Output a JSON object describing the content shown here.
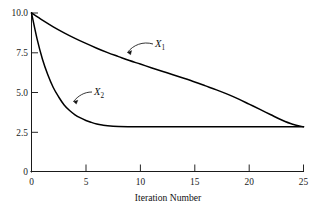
{
  "chart_data": {
    "type": "line",
    "title": "",
    "subtitle": "",
    "xlabel": "Iteration Number",
    "ylabel": "",
    "xlim": [
      0,
      25
    ],
    "ylim": [
      0,
      10.0
    ],
    "grid": false,
    "legend_position": "inline-annotations",
    "xticks": [
      0,
      5,
      10,
      15,
      20,
      25
    ],
    "xticklabels": [
      "0",
      "5",
      "10",
      "15",
      "20",
      "25"
    ],
    "yticks": [
      0,
      2.5,
      5.0,
      7.5,
      10.0
    ],
    "yticklabels": [
      "0",
      "2.5",
      "5.0",
      "7.5",
      "10.0"
    ],
    "annotations": [
      {
        "text": "X",
        "subscript": "1",
        "series": "X1"
      },
      {
        "text": "X",
        "subscript": "2",
        "series": "X2"
      }
    ],
    "series": [
      {
        "name": "X1",
        "label": "X",
        "label_subscript": "1",
        "x": [
          0,
          1,
          2,
          3,
          4,
          5,
          6,
          7,
          8,
          9,
          10,
          11,
          12,
          13,
          14,
          15,
          16,
          17,
          18,
          19,
          20,
          21,
          22,
          23,
          24,
          25
        ],
        "values": [
          10.0,
          9.55,
          9.13,
          8.75,
          8.4,
          8.08,
          7.78,
          7.5,
          7.25,
          7.0,
          6.78,
          6.55,
          6.33,
          6.1,
          5.88,
          5.65,
          5.4,
          5.15,
          4.88,
          4.58,
          4.25,
          3.92,
          3.58,
          3.25,
          2.98,
          2.82
        ]
      },
      {
        "name": "X2",
        "label": "X",
        "label_subscript": "2",
        "x": [
          0,
          0.5,
          1,
          1.5,
          2,
          2.5,
          3,
          3.5,
          4,
          4.5,
          5,
          5.5,
          6,
          6.5,
          7,
          8,
          10,
          12,
          14,
          16,
          18,
          20,
          22,
          24,
          25
        ],
        "values": [
          10.0,
          8.4,
          7.1,
          6.1,
          5.3,
          4.7,
          4.2,
          3.85,
          3.58,
          3.38,
          3.22,
          3.1,
          3.0,
          2.93,
          2.88,
          2.84,
          2.82,
          2.82,
          2.82,
          2.82,
          2.82,
          2.82,
          2.82,
          2.82,
          2.82
        ]
      }
    ]
  },
  "axes": {
    "x_title": "Iteration Number",
    "x_tick_labels": [
      "0",
      "5",
      "10",
      "15",
      "20",
      "25"
    ],
    "y_tick_labels": [
      "10.0",
      "7.5",
      "5.0",
      "2.5",
      "0"
    ]
  },
  "labels": {
    "x1_base": "X",
    "x1_sub": "1",
    "x2_base": "X",
    "x2_sub": "2"
  },
  "colors": {
    "background": "#ffffff",
    "axis": "#1a1a1a",
    "curve": "#000000",
    "text": "#111111"
  }
}
